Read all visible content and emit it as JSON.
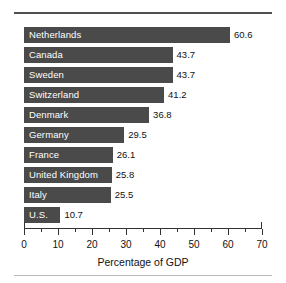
{
  "figure": {
    "background_color": "#ffffff",
    "rule_top_color": "#4f4f4f",
    "rule_bottom_color": "#b9b9b9"
  },
  "chart_data": {
    "type": "bar",
    "orientation": "horizontal",
    "title": "",
    "subtitle": "",
    "xlabel": "Percentage of GDP",
    "ylabel": "",
    "xlim": [
      0,
      70
    ],
    "ylim": null,
    "grid": false,
    "legend": null,
    "bar_color": "#4a4a4a",
    "bar_label_color": "#ffffff",
    "value_label_color": "#111111",
    "categories": [
      "Netherlands",
      "Canada",
      "Sweden",
      "Switzerland",
      "Denmark",
      "Germany",
      "France",
      "United Kingdom",
      "Italy",
      "U.S."
    ],
    "values": [
      60.6,
      43.7,
      43.7,
      41.2,
      36.8,
      29.5,
      26.1,
      25.8,
      25.5,
      10.7
    ],
    "value_labels": [
      "60.6",
      "43.7",
      "43.7",
      "41.2",
      "36.8",
      "29.5",
      "26.1",
      "25.8",
      "25.5",
      "10.7"
    ],
    "xticks": [
      0,
      10,
      20,
      30,
      40,
      50,
      60,
      70
    ],
    "xtick_labels": [
      "0",
      "10",
      "20",
      "30",
      "40",
      "50",
      "60",
      "70"
    ],
    "xticks_minor": [
      5,
      15,
      25,
      35,
      45,
      55,
      65
    ],
    "bars": [
      {
        "category": "Netherlands",
        "value": 60.6,
        "value_label": "60.6"
      },
      {
        "category": "Canada",
        "value": 43.7,
        "value_label": "43.7"
      },
      {
        "category": "Sweden",
        "value": 43.7,
        "value_label": "43.7"
      },
      {
        "category": "Switzerland",
        "value": 41.2,
        "value_label": "41.2"
      },
      {
        "category": "Denmark",
        "value": 36.8,
        "value_label": "36.8"
      },
      {
        "category": "Germany",
        "value": 29.5,
        "value_label": "29.5"
      },
      {
        "category": "France",
        "value": 26.1,
        "value_label": "26.1"
      },
      {
        "category": "United Kingdom",
        "value": 25.8,
        "value_label": "25.8"
      },
      {
        "category": "Italy",
        "value": 25.5,
        "value_label": "25.5"
      },
      {
        "category": "U.S.",
        "value": 10.7,
        "value_label": "10.7"
      }
    ]
  }
}
